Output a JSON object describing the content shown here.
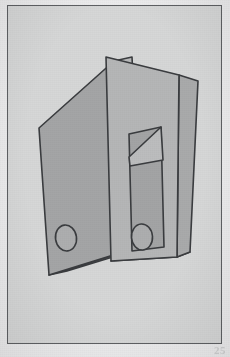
{
  "page": {
    "page_number": "25",
    "background_color": "#ececed",
    "plate_background_color": "#d6d7d7",
    "plate_border_color": "#5e6063"
  },
  "figure": {
    "ink_color": "#3a3c3f",
    "palette": {
      "left_binder_front": "#a4a5a6",
      "left_binder_spine": "#b9babb",
      "left_binder_bottom": "#9c9d9e",
      "right_binder_front": "#b5b6b7",
      "right_binder_side": "#a9aaab",
      "right_binder_inner_slot": "#a3a4a5",
      "right_binder_inner_fold": "#bcbdbe",
      "right_binder_bottom": "#9fa0a1",
      "hole_fill": "#aeafb0"
    },
    "shapes": [
      {
        "name": "left-binder",
        "kind": "box",
        "front_face": "38,129 113,62 122,253 48,276",
        "spine_face": "113,62 131,58 141,249 122,253",
        "bottom_face": "48,276 122,253 141,249 66,272",
        "hole": {
          "cx": 65,
          "cy": 239,
          "rx": 11,
          "ry": 13,
          "rotate": -8
        }
      },
      {
        "name": "right-binder",
        "kind": "box",
        "front_face": "105,58 178,76 176,258 110,262",
        "side_face": "178,76 196,82 188,253 176,258",
        "bottom_face": "110,262 176,258 188,253 122,258",
        "inner_slot": "128,135 160,128 163,248 131,252",
        "inner_fold": "128,158 160,128 163,160 131,168",
        "hole": {
          "cx": 133,
          "cy": 238,
          "rx": 11,
          "ry": 13,
          "rotate": -4
        }
      }
    ]
  }
}
